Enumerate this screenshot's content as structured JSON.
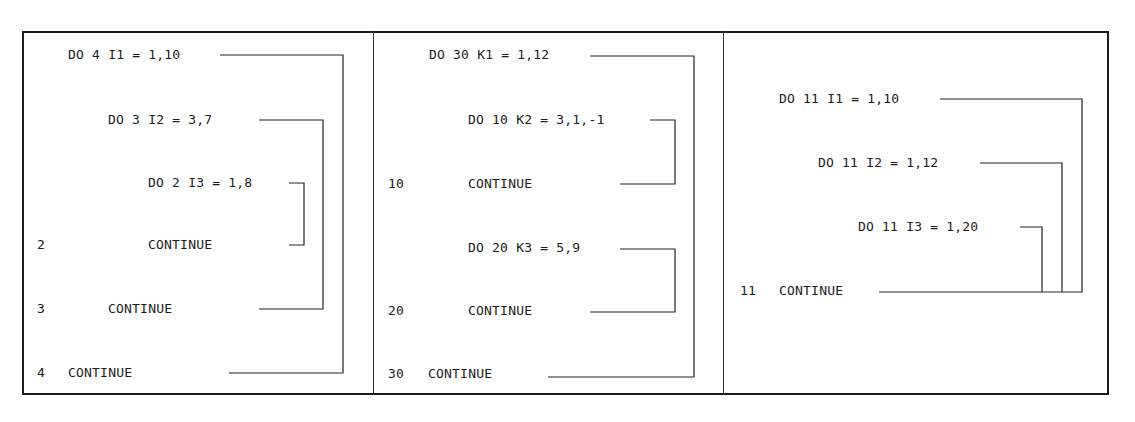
{
  "panels": [
    {
      "name": "nested-loops-different-labels",
      "lines": [
        {
          "label": "",
          "stmt": "DO 4 I1 = 1,10"
        },
        {
          "label": "",
          "stmt": "DO 3 I2 = 3,7"
        },
        {
          "label": "",
          "stmt": "DO 2 I3 = 1,8"
        },
        {
          "label": "2",
          "stmt": "CONTINUE"
        },
        {
          "label": "3",
          "stmt": "CONTINUE"
        },
        {
          "label": "4",
          "stmt": "CONTINUE"
        }
      ]
    },
    {
      "name": "sequential-inner-loops",
      "lines": [
        {
          "label": "",
          "stmt": "DO 30 K1 = 1,12"
        },
        {
          "label": "",
          "stmt": "DO 10 K2 = 3,1,-1"
        },
        {
          "label": "10",
          "stmt": "CONTINUE"
        },
        {
          "label": "",
          "stmt": "DO 20 K3 = 5,9"
        },
        {
          "label": "20",
          "stmt": "CONTINUE"
        },
        {
          "label": "30",
          "stmt": "CONTINUE"
        }
      ]
    },
    {
      "name": "shared-terminal-statement",
      "lines": [
        {
          "label": "",
          "stmt": "DO 11 I1 = 1,10"
        },
        {
          "label": "",
          "stmt": "DO 11 I2 = 1,12"
        },
        {
          "label": "",
          "stmt": "DO 11 I3 = 1,20"
        },
        {
          "label": "11",
          "stmt": "CONTINUE"
        }
      ]
    }
  ],
  "colors": {
    "ink": "#1a1a1a",
    "background": "#ffffff"
  }
}
